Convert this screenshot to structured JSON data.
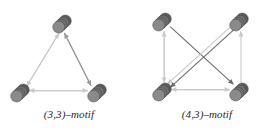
{
  "figure": {
    "type": "diagram",
    "background_color": "#ffffff",
    "node_style": {
      "shape": "stacked-disc-cylinder",
      "disc_count": 4,
      "disc_radius_px": 6,
      "stack_offset_px": 2.6,
      "fill_dark": "#5a5a5a",
      "fill_mid": "#6e6e6e",
      "fill_light": "#8a8a8a",
      "stroke": "#4a4a4a"
    },
    "edge_style": {
      "stroke_light": "#c9c9c9",
      "stroke_mid": "#9a9a9a",
      "stroke_dark": "#6b6b6b",
      "arrow_fill": "#7a7a7a",
      "width_px": 1.1
    },
    "panels": [
      {
        "id": "panel-left",
        "caption": "(3,3)–motif",
        "node_count": 3,
        "edge_count": 6,
        "nodes": [
          {
            "id": "t",
            "label": "top",
            "cx": 62,
            "cy": 24
          },
          {
            "id": "bl",
            "label": "bottom-left",
            "cx": 20,
            "cy": 93
          },
          {
            "id": "br",
            "label": "bottom-right",
            "cx": 97,
            "cy": 93
          }
        ],
        "edges": [
          {
            "from": "t",
            "to": "bl",
            "offset": -2.2,
            "shade": "light"
          },
          {
            "from": "bl",
            "to": "t",
            "offset": 2.2,
            "shade": "light"
          },
          {
            "from": "br",
            "to": "t",
            "offset": -2.0,
            "shade": "mid"
          },
          {
            "from": "t",
            "to": "br",
            "offset": 2.0,
            "shade": "mid"
          },
          {
            "from": "bl",
            "to": "br",
            "offset": -2.4,
            "shade": "light"
          },
          {
            "from": "br",
            "to": "bl",
            "offset": 2.4,
            "shade": "light"
          }
        ]
      },
      {
        "id": "panel-right",
        "caption": "(4,3)–motif",
        "node_count": 4,
        "edge_count": 8,
        "nodes": [
          {
            "id": "tl",
            "label": "top-left",
            "cx": 24,
            "cy": 22
          },
          {
            "id": "tr",
            "label": "top-right",
            "cx": 101,
            "cy": 22
          },
          {
            "id": "bl",
            "label": "bottom-left",
            "cx": 24,
            "cy": 92
          },
          {
            "id": "br",
            "label": "bottom-right",
            "cx": 101,
            "cy": 92
          }
        ],
        "edges": [
          {
            "from": "tl",
            "to": "bl",
            "offset": -2.2,
            "shade": "light"
          },
          {
            "from": "bl",
            "to": "tl",
            "offset": 2.2,
            "shade": "light"
          },
          {
            "from": "tl",
            "to": "br",
            "offset": -2.0,
            "shade": "dark"
          },
          {
            "from": "tr",
            "to": "bl",
            "offset": -2.2,
            "shade": "dark"
          },
          {
            "from": "tr",
            "to": "bl",
            "offset": 2.2,
            "shade": "light"
          },
          {
            "from": "br",
            "to": "tr",
            "offset": 2.0,
            "shade": "light"
          },
          {
            "from": "bl",
            "to": "br",
            "offset": -2.4,
            "shade": "light"
          },
          {
            "from": "br",
            "to": "bl",
            "offset": 2.4,
            "shade": "light"
          }
        ]
      }
    ]
  }
}
